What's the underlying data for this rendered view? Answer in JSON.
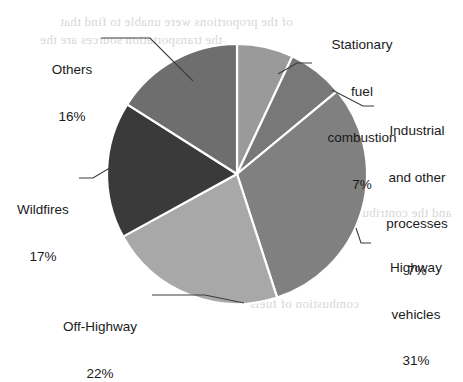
{
  "figure": {
    "width": 463,
    "height": 341,
    "background": "#ffffff"
  },
  "scan_artifacts": {
    "description": "faint mirrored bleed-through text from reverse of scanned page",
    "lines": [
      "of the proportions were unable to find that",
      "the transportation sources are the",
      "and the contributions of the",
      "combustion of fuels"
    ]
  },
  "chart_data": {
    "type": "pie",
    "title": "",
    "categories": [
      "Stationary fuel combustion",
      "Industrial and other processes",
      "Highway vehicles",
      "Off-Highway",
      "Wildfires",
      "Others"
    ],
    "values": [
      7,
      7,
      31,
      22,
      17,
      16
    ],
    "value_labels": [
      "7%",
      "7%",
      "31%",
      "22%",
      "17%",
      "16%"
    ],
    "unit": "%",
    "start_angle_deg": 0,
    "direction": "clockwise",
    "legend": "none (direct labels with leader lines)",
    "slice_colors": [
      "#9a9a9a",
      "#787878",
      "#808080",
      "#a8a8a8",
      "#3a3a3a",
      "#6e6e6e"
    ],
    "edge_color": "#ffffff",
    "geometry": {
      "cx": 237,
      "cy": 174,
      "r": 130
    },
    "slices": [
      {
        "name": "Stationary fuel combustion",
        "label_lines": [
          "Stationary",
          "fuel",
          "combustion"
        ],
        "percent_label": "7%",
        "value": 7,
        "color": "#9a9a9a",
        "start_deg": 0,
        "end_deg": 25.2
      },
      {
        "name": "Industrial and other processes",
        "label_lines": [
          "Industrial",
          "and other",
          "processes"
        ],
        "percent_label": "7%",
        "value": 7,
        "color": "#787878",
        "start_deg": 25.2,
        "end_deg": 50.4
      },
      {
        "name": "Highway vehicles",
        "label_lines": [
          "Highway",
          "vehicles"
        ],
        "percent_label": "31%",
        "value": 31,
        "color": "#808080",
        "start_deg": 50.4,
        "end_deg": 162.0
      },
      {
        "name": "Off-Highway",
        "label_lines": [
          "Off-Highway"
        ],
        "percent_label": "22%",
        "value": 22,
        "color": "#a8a8a8",
        "start_deg": 162.0,
        "end_deg": 241.2
      },
      {
        "name": "Wildfires",
        "label_lines": [
          "Wildfires"
        ],
        "percent_label": "17%",
        "value": 17,
        "color": "#3a3a3a",
        "start_deg": 241.2,
        "end_deg": 302.4
      },
      {
        "name": "Others",
        "label_lines": [
          "Others"
        ],
        "percent_label": "16%",
        "value": 16,
        "color": "#6e6e6e",
        "start_deg": 302.4,
        "end_deg": 360.0
      }
    ]
  },
  "labels": {
    "stationary": {
      "line1": "Stationary",
      "line2": "fuel",
      "line3": "combustion",
      "pct": "7%"
    },
    "industrial": {
      "line1": "Industrial",
      "line2": "and other",
      "line3": "processes",
      "pct": "7%"
    },
    "highway": {
      "line1": "Highway",
      "line2": "vehicles",
      "pct": "31%"
    },
    "offhighway": {
      "line1": "Off-Highway",
      "pct": "22%"
    },
    "wildfires": {
      "line1": "Wildfires",
      "pct": "17%"
    },
    "others": {
      "line1": "Others",
      "pct": "16%"
    }
  }
}
